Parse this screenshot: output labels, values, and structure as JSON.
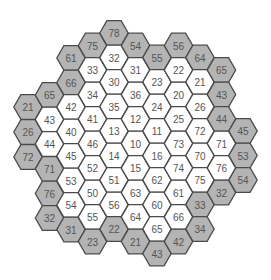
{
  "board": {
    "colors": {
      "border_cell_fill": "#b4b4b4",
      "inner_cell_fill": "#ffffff",
      "stroke": "#4a4a4a",
      "text": "#555555"
    },
    "cells": [
      {
        "x": 28,
        "y": 107,
        "label": "21",
        "border": true
      },
      {
        "x": 28,
        "y": 132,
        "label": "26",
        "border": true
      },
      {
        "x": 28,
        "y": 157,
        "label": "72",
        "border": true
      },
      {
        "x": 49.5,
        "y": 95,
        "label": "65",
        "border": true
      },
      {
        "x": 49.5,
        "y": 119.5,
        "label": "43",
        "border": false
      },
      {
        "x": 49.5,
        "y": 144,
        "label": "44",
        "border": false
      },
      {
        "x": 49.5,
        "y": 169,
        "label": "71",
        "border": true
      },
      {
        "x": 49.5,
        "y": 193.5,
        "label": "76",
        "border": true
      },
      {
        "x": 49.5,
        "y": 218,
        "label": "32",
        "border": true
      },
      {
        "x": 71,
        "y": 58,
        "label": "61",
        "border": true
      },
      {
        "x": 71,
        "y": 82.5,
        "label": "66",
        "border": true
      },
      {
        "x": 71,
        "y": 107,
        "label": "42",
        "border": false
      },
      {
        "x": 71,
        "y": 131.5,
        "label": "40",
        "border": false
      },
      {
        "x": 71,
        "y": 156,
        "label": "45",
        "border": false
      },
      {
        "x": 71,
        "y": 180.5,
        "label": "53",
        "border": false
      },
      {
        "x": 71,
        "y": 205,
        "label": "54",
        "border": false
      },
      {
        "x": 71,
        "y": 229.5,
        "label": "31",
        "border": true
      },
      {
        "x": 92.5,
        "y": 45.5,
        "label": "75",
        "border": true
      },
      {
        "x": 92.5,
        "y": 70,
        "label": "33",
        "border": false
      },
      {
        "x": 92.5,
        "y": 94.5,
        "label": "34",
        "border": false
      },
      {
        "x": 92.5,
        "y": 119,
        "label": "41",
        "border": false
      },
      {
        "x": 92.5,
        "y": 143.5,
        "label": "46",
        "border": false
      },
      {
        "x": 92.5,
        "y": 168,
        "label": "52",
        "border": false
      },
      {
        "x": 92.5,
        "y": 192.5,
        "label": "50",
        "border": false
      },
      {
        "x": 92.5,
        "y": 217,
        "label": "55",
        "border": false
      },
      {
        "x": 92.5,
        "y": 241.5,
        "label": "23",
        "border": true
      },
      {
        "x": 114,
        "y": 33,
        "label": "78",
        "border": true
      },
      {
        "x": 114,
        "y": 57.5,
        "label": "32",
        "border": false
      },
      {
        "x": 114,
        "y": 82,
        "label": "30",
        "border": false
      },
      {
        "x": 114,
        "y": 106.5,
        "label": "35",
        "border": false
      },
      {
        "x": 114,
        "y": 131,
        "label": "13",
        "border": false
      },
      {
        "x": 114,
        "y": 155.5,
        "label": "14",
        "border": false
      },
      {
        "x": 114,
        "y": 180,
        "label": "51",
        "border": false
      },
      {
        "x": 114,
        "y": 204.5,
        "label": "56",
        "border": false
      },
      {
        "x": 114,
        "y": 229,
        "label": "22",
        "border": true
      },
      {
        "x": 135.5,
        "y": 45.5,
        "label": "54",
        "border": true
      },
      {
        "x": 135.5,
        "y": 70,
        "label": "31",
        "border": false
      },
      {
        "x": 135.5,
        "y": 94.5,
        "label": "36",
        "border": false
      },
      {
        "x": 135.5,
        "y": 119,
        "label": "12",
        "border": false
      },
      {
        "x": 135.5,
        "y": 143.5,
        "label": "10",
        "border": false
      },
      {
        "x": 135.5,
        "y": 168,
        "label": "15",
        "border": false
      },
      {
        "x": 135.5,
        "y": 192.5,
        "label": "63",
        "border": false
      },
      {
        "x": 135.5,
        "y": 217,
        "label": "64",
        "border": false
      },
      {
        "x": 135.5,
        "y": 241.5,
        "label": "21",
        "border": true
      },
      {
        "x": 157,
        "y": 57.5,
        "label": "55",
        "border": true
      },
      {
        "x": 157,
        "y": 82,
        "label": "23",
        "border": false
      },
      {
        "x": 157,
        "y": 106.5,
        "label": "24",
        "border": false
      },
      {
        "x": 157,
        "y": 131,
        "label": "11",
        "border": false
      },
      {
        "x": 157,
        "y": 155.5,
        "label": "16",
        "border": false
      },
      {
        "x": 157,
        "y": 180,
        "label": "62",
        "border": false
      },
      {
        "x": 157,
        "y": 204.5,
        "label": "60",
        "border": false
      },
      {
        "x": 157,
        "y": 229,
        "label": "65",
        "border": false
      },
      {
        "x": 157,
        "y": 253.5,
        "label": "43",
        "border": true
      },
      {
        "x": 178.5,
        "y": 45.5,
        "label": "56",
        "border": true
      },
      {
        "x": 178.5,
        "y": 70,
        "label": "22",
        "border": false
      },
      {
        "x": 178.5,
        "y": 94.5,
        "label": "20",
        "border": false
      },
      {
        "x": 178.5,
        "y": 119,
        "label": "25",
        "border": false
      },
      {
        "x": 178.5,
        "y": 143.5,
        "label": "73",
        "border": false
      },
      {
        "x": 178.5,
        "y": 168,
        "label": "74",
        "border": false
      },
      {
        "x": 178.5,
        "y": 192.5,
        "label": "61",
        "border": false
      },
      {
        "x": 178.5,
        "y": 217,
        "label": "66",
        "border": false
      },
      {
        "x": 178.5,
        "y": 241.5,
        "label": "42",
        "border": true
      },
      {
        "x": 200,
        "y": 57.5,
        "label": "64",
        "border": true
      },
      {
        "x": 200,
        "y": 82,
        "label": "21",
        "border": false
      },
      {
        "x": 200,
        "y": 106.5,
        "label": "26",
        "border": false
      },
      {
        "x": 200,
        "y": 131,
        "label": "72",
        "border": false
      },
      {
        "x": 200,
        "y": 155.5,
        "label": "70",
        "border": false
      },
      {
        "x": 200,
        "y": 180,
        "label": "75",
        "border": false
      },
      {
        "x": 200,
        "y": 204.5,
        "label": "33",
        "border": true
      },
      {
        "x": 200,
        "y": 229,
        "label": "34",
        "border": true
      },
      {
        "x": 221.5,
        "y": 70,
        "label": "65",
        "border": true
      },
      {
        "x": 221.5,
        "y": 94.5,
        "label": "43",
        "border": true
      },
      {
        "x": 221.5,
        "y": 119,
        "label": "44",
        "border": true
      },
      {
        "x": 221.5,
        "y": 143.5,
        "label": "71",
        "border": false
      },
      {
        "x": 221.5,
        "y": 168,
        "label": "76",
        "border": false
      },
      {
        "x": 221.5,
        "y": 192.5,
        "label": "32",
        "border": true
      },
      {
        "x": 243,
        "y": 131,
        "label": "45",
        "border": true
      },
      {
        "x": 243,
        "y": 155.5,
        "label": "53",
        "border": true
      },
      {
        "x": 243,
        "y": 180,
        "label": "54",
        "border": true
      }
    ]
  }
}
